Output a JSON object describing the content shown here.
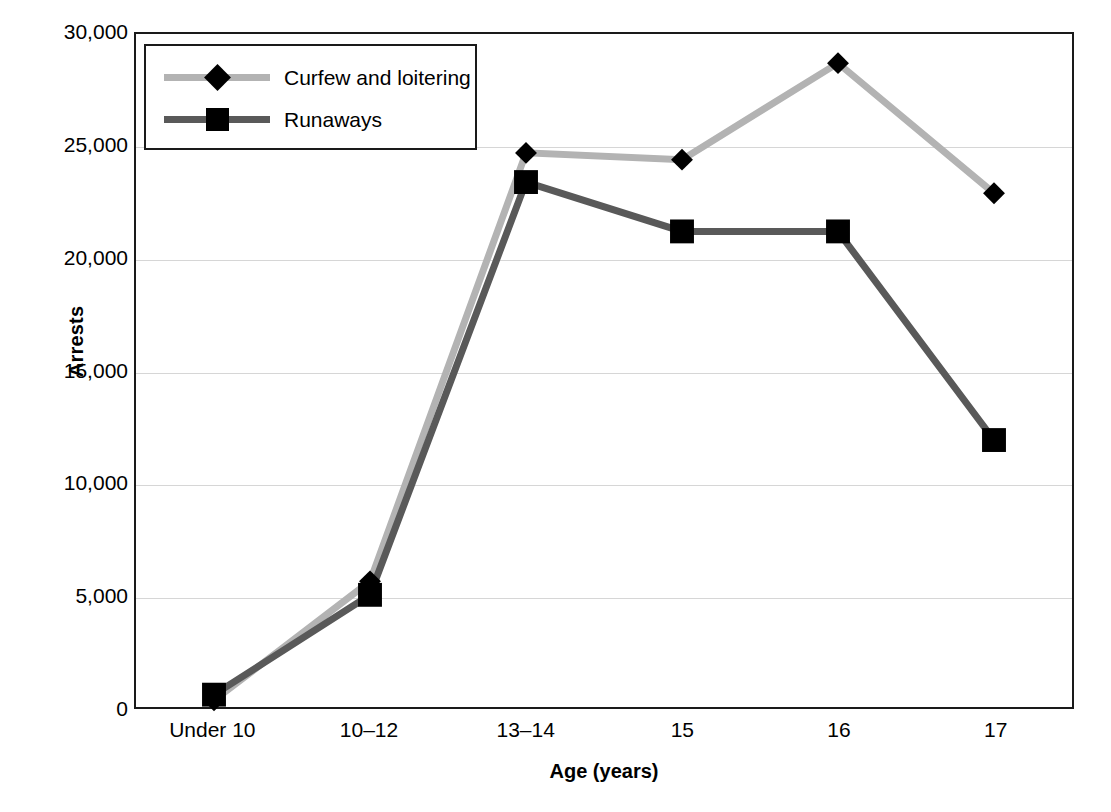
{
  "chart_data": {
    "type": "line",
    "title": "",
    "xlabel": "Age (years)",
    "ylabel": "Arrests",
    "categories": [
      "Under 10",
      "10–12",
      "13–14",
      "15",
      "16",
      "17"
    ],
    "ylim": [
      0,
      30000
    ],
    "ytick_values": [
      0,
      5000,
      10000,
      15000,
      20000,
      25000,
      30000
    ],
    "ytick_labels": [
      "0",
      "5,000",
      "10,000",
      "15,000",
      "20,000",
      "25,000",
      "30,000"
    ],
    "grid": true,
    "legend_position": "top-left inside",
    "series": [
      {
        "name": "Curfew and loitering",
        "marker": "diamond",
        "color": "#b3b3b3",
        "marker_color": "#000000",
        "values": [
          300,
          5600,
          24700,
          24400,
          28700,
          22900
        ]
      },
      {
        "name": "Runaways",
        "marker": "square",
        "color": "#595959",
        "marker_color": "#000000",
        "values": [
          550,
          5000,
          23400,
          21200,
          21200,
          11900
        ]
      }
    ]
  },
  "axes": {
    "y_title": "Arrests",
    "x_title": "Age (years)"
  },
  "legend": {
    "items": [
      {
        "label": "Curfew and loitering",
        "marker": "diamond"
      },
      {
        "label": "Runaways",
        "marker": "square"
      }
    ]
  },
  "colors": {
    "series_curfew": "#b3b3b3",
    "series_runaways": "#595959",
    "marker": "#000000",
    "gridline": "#d6d6d6",
    "frame": "#1a1a1a"
  }
}
